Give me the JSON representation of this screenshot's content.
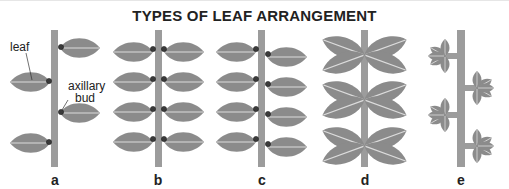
{
  "title": "TYPES OF LEAF ARRANGEMENT",
  "colors": {
    "leaf": "#8b8b8b",
    "stem": "#9c9c9c",
    "midrib": "#dcdcdc",
    "bud": "#3a3a3a",
    "text": "#222222"
  },
  "callouts": {
    "leaf": "leaf",
    "bud_line1": "axillary",
    "bud_line2": "bud"
  },
  "panels": [
    {
      "label": "a",
      "arrangement": "alternate",
      "leaves": 4
    },
    {
      "label": "b",
      "arrangement": "opposite",
      "leaves": 8
    },
    {
      "label": "c",
      "arrangement": "sub-opposite",
      "leaves": 8
    },
    {
      "label": "d",
      "arrangement": "whorled",
      "leaves": 12
    },
    {
      "label": "e",
      "arrangement": "compound / palmate on alternate branches",
      "leaves": 4
    }
  ]
}
